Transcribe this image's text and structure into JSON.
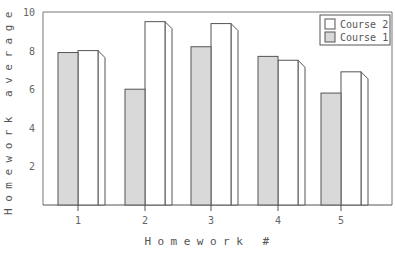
{
  "chart_data": {
    "type": "bar",
    "title": "",
    "xlabel": "Homework #",
    "ylabel": "Homework average",
    "categories": [
      "1",
      "2",
      "3",
      "4",
      "5"
    ],
    "series": [
      {
        "name": "Course 1",
        "color": "#d9d9d9",
        "values": [
          7.9,
          6.0,
          8.2,
          7.7,
          5.8
        ]
      },
      {
        "name": "Course 2",
        "color": "#ffffff",
        "values": [
          8.0,
          9.5,
          9.4,
          7.5,
          6.9
        ]
      }
    ],
    "yticks": [
      2,
      4,
      6,
      8,
      10
    ],
    "ylim": [
      0,
      10
    ],
    "grid": false,
    "legend_position": "top-right",
    "legend_order": [
      "Course 2",
      "Course 1"
    ],
    "style": "3d-bar"
  },
  "legend": {
    "items": [
      {
        "label": "Course 2",
        "color": "#ffffff"
      },
      {
        "label": "Course 1",
        "color": "#d9d9d9"
      }
    ]
  },
  "colors": {
    "edge": "#555555",
    "frame": "#777777",
    "course1_fill": "#d9d9d9",
    "course2_fill": "#ffffff"
  }
}
